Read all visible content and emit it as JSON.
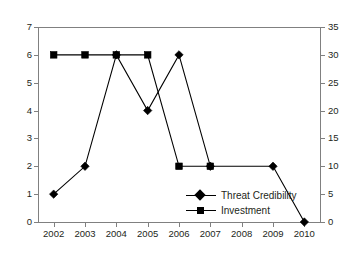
{
  "chart_data": {
    "type": "line",
    "title": "",
    "xlabel": "",
    "ylabel": "",
    "categories": [
      "2002",
      "2003",
      "2004",
      "2005",
      "2006",
      "2007",
      "2008",
      "2009",
      "2010"
    ],
    "grid": false,
    "legend_position": "inside-bottom-right",
    "axes": {
      "left": {
        "ylim": [
          0,
          7
        ],
        "ticks": [
          "0",
          "1",
          "2",
          "3",
          "4",
          "5",
          "6",
          "7"
        ],
        "applies_to": "Threat Credibility"
      },
      "right": {
        "ylim": [
          0,
          35
        ],
        "ticks": [
          "0",
          "5",
          "10",
          "15",
          "20",
          "25",
          "30",
          "35"
        ],
        "applies_to": "Investment"
      }
    },
    "series": [
      {
        "name": "Threat Credibility",
        "marker": "diamond",
        "axis": "left",
        "x": [
          "2002",
          "2003",
          "2004",
          "2005",
          "2006",
          "2007",
          "2009",
          "2010"
        ],
        "values": [
          1,
          2,
          6,
          4,
          6,
          2,
          2,
          0
        ]
      },
      {
        "name": "Investment",
        "marker": "square",
        "axis": "right",
        "x": [
          "2002",
          "2003",
          "2004",
          "2005",
          "2006",
          "2007"
        ],
        "values": [
          30,
          30,
          30,
          30,
          10,
          10
        ]
      }
    ]
  },
  "legend": {
    "items": [
      {
        "label": "Threat Credibility",
        "marker": "diamond"
      },
      {
        "label": "Investment",
        "marker": "square"
      }
    ]
  },
  "colors": {
    "series": "#000000",
    "axis": "#808080",
    "text": "#231f20",
    "background": "#ffffff"
  }
}
